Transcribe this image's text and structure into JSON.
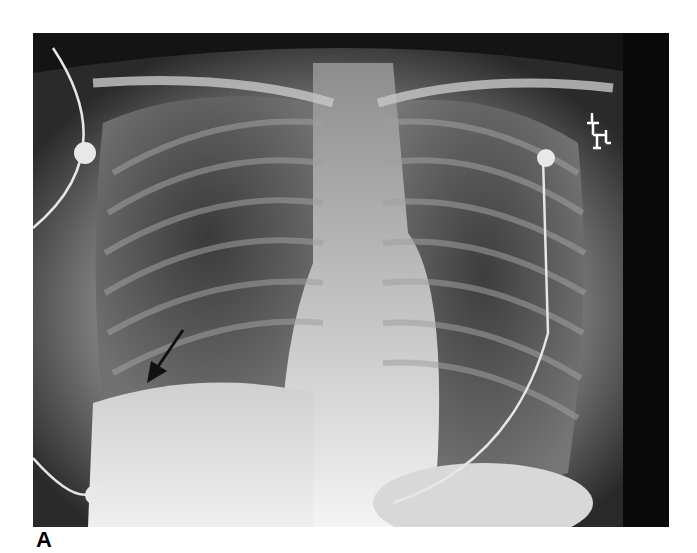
{
  "figure": {
    "panel_label": "A",
    "image_description": "Frontal chest radiograph with arrow pointing to right hemidiaphragm region",
    "annotations": [
      {
        "type": "arrow",
        "direction": "down-left",
        "location": "right lower lung base"
      }
    ],
    "markers": [
      "ECG electrode leads",
      "radiographic side marker"
    ]
  }
}
